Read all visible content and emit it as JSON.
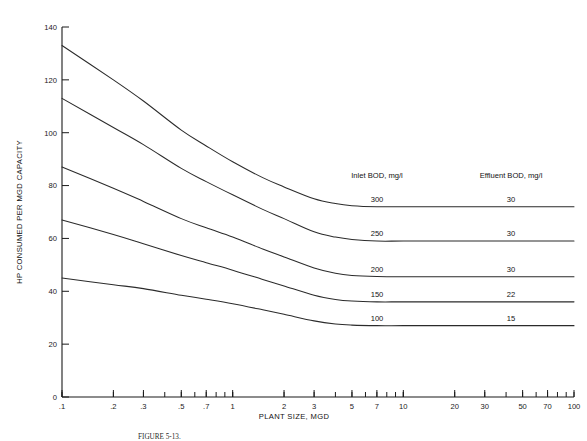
{
  "figure": {
    "caption": "FIGURE 5-13.",
    "background_color": "#ffffff",
    "line_color": "#2b2b2b",
    "text_color": "#121212"
  },
  "chart_data": {
    "type": "line",
    "title": "",
    "xlabel": "PLANT SIZE, MGD",
    "ylabel": "HP CONSUMED PER MGD CAPACITY",
    "xscale": "log",
    "xlim": [
      0.1,
      100
    ],
    "ylim": [
      0,
      140
    ],
    "grid": false,
    "legend_position": "inline-right",
    "xticks": [
      0.1,
      0.2,
      0.3,
      0.5,
      0.7,
      1,
      2,
      3,
      5,
      7,
      10,
      20,
      30,
      50,
      70,
      100
    ],
    "xtick_labels": [
      ".1",
      ".2",
      ".3",
      ".5",
      ".7",
      "1",
      "2",
      "3",
      "5",
      "7",
      "10",
      "20",
      "30",
      "50",
      "70",
      "100"
    ],
    "yticks": [
      0,
      20,
      40,
      60,
      80,
      100,
      120,
      140
    ],
    "ytick_labels": [
      "0",
      "20",
      "40",
      "60",
      "80",
      "100",
      "120",
      "140"
    ],
    "legend_headers": {
      "inlet": "Inlet BOD, mg/l",
      "effluent": "Effluent BOD, mg/l"
    },
    "series": [
      {
        "name": "Inlet BOD 300 mg/l",
        "inlet_bod": "300",
        "effluent_bod": "30",
        "x": [
          0.1,
          0.2,
          0.3,
          0.5,
          0.7,
          1,
          1.5,
          2,
          3,
          4,
          5,
          7,
          10,
          20,
          30,
          50,
          70,
          100
        ],
        "y": [
          133,
          120,
          112,
          101,
          95,
          89,
          83,
          79.5,
          75,
          73.2,
          72.4,
          72,
          72,
          72,
          72,
          72,
          72,
          72
        ]
      },
      {
        "name": "Inlet BOD 250 mg/l",
        "inlet_bod": "250",
        "effluent_bod": "30",
        "x": [
          0.1,
          0.2,
          0.3,
          0.5,
          0.7,
          1,
          1.5,
          2,
          3,
          4,
          5,
          7,
          10,
          20,
          30,
          50,
          70,
          100
        ],
        "y": [
          113,
          102,
          95.5,
          86.5,
          81.5,
          76.5,
          71,
          67.5,
          62.5,
          60.5,
          59.6,
          59,
          59,
          59,
          59,
          59,
          59,
          59
        ]
      },
      {
        "name": "Inlet BOD 200 mg/l",
        "inlet_bod": "200",
        "effluent_bod": "30",
        "x": [
          0.1,
          0.2,
          0.3,
          0.5,
          0.7,
          1,
          1.5,
          2,
          3,
          4,
          5,
          7,
          10,
          20,
          30,
          50,
          70,
          100
        ],
        "y": [
          87,
          79,
          74,
          67.5,
          64,
          60.5,
          56,
          53,
          48.8,
          46.8,
          46,
          45.6,
          45.5,
          45.5,
          45.5,
          45.5,
          45.5,
          45.5
        ]
      },
      {
        "name": "Inlet BOD 150 mg/l",
        "inlet_bod": "150",
        "effluent_bod": "22",
        "x": [
          0.1,
          0.2,
          0.3,
          0.5,
          0.7,
          1,
          1.5,
          2,
          3,
          4,
          5,
          7,
          10,
          20,
          30,
          50,
          70,
          100
        ],
        "y": [
          67,
          61.5,
          58,
          53.5,
          50.8,
          48,
          44.5,
          42,
          38.5,
          36.9,
          36.3,
          36,
          36,
          36,
          36,
          36,
          36,
          36
        ]
      },
      {
        "name": "Inlet BOD 100 mg/l",
        "inlet_bod": "100",
        "effluent_bod": "15",
        "x": [
          0.1,
          0.2,
          0.3,
          0.5,
          0.7,
          1,
          1.5,
          2,
          3,
          4,
          5,
          7,
          10,
          20,
          30,
          50,
          70,
          100
        ],
        "y": [
          45,
          42.5,
          41,
          38.5,
          37,
          35.3,
          33,
          31.3,
          28.8,
          27.6,
          27.2,
          27,
          27,
          27,
          27,
          27,
          27,
          27
        ]
      }
    ],
    "annotations": [
      {
        "text": "300",
        "series": 0,
        "role": "inlet-label"
      },
      {
        "text": "250",
        "series": 1,
        "role": "inlet-label"
      },
      {
        "text": "200",
        "series": 2,
        "role": "inlet-label"
      },
      {
        "text": "150",
        "series": 3,
        "role": "inlet-label"
      },
      {
        "text": "100",
        "series": 4,
        "role": "inlet-label"
      },
      {
        "text": "30",
        "series": 0,
        "role": "effluent-label"
      },
      {
        "text": "30",
        "series": 1,
        "role": "effluent-label"
      },
      {
        "text": "30",
        "series": 2,
        "role": "effluent-label"
      },
      {
        "text": "22",
        "series": 3,
        "role": "effluent-label"
      },
      {
        "text": "15",
        "series": 4,
        "role": "effluent-label"
      }
    ]
  }
}
